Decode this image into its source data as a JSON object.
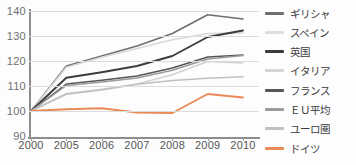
{
  "chart_data": {
    "type": "line",
    "title": "",
    "xlabel": "",
    "ylabel": "",
    "x": [
      "2000",
      "2005",
      "2006",
      "2007",
      "2008",
      "2009",
      "2010"
    ],
    "ylim": [
      90,
      140
    ],
    "yticks": [
      90,
      100,
      110,
      120,
      130,
      140
    ],
    "grid": true,
    "legend_position": "right",
    "series": [
      {
        "name": "ギリシャ",
        "color": "#6e6e6e",
        "values": [
          100,
          118,
          122,
          126,
          131,
          138.5,
          136.8
        ]
      },
      {
        "name": "スペイン",
        "color": "#d8d8d8",
        "values": [
          100,
          117.5,
          121.5,
          125,
          128.5,
          131,
          131.2
        ]
      },
      {
        "name": "英国",
        "color": "#3c3c3c",
        "values": [
          100,
          113.3,
          115.5,
          118,
          122,
          129.6,
          132.2
        ]
      },
      {
        "name": "イタリア",
        "color": "#d2d2d2",
        "values": [
          100,
          107,
          108.7,
          110.8,
          114.5,
          119.8,
          119.2
        ]
      },
      {
        "name": "フランス",
        "color": "#565656",
        "values": [
          100,
          110.8,
          112.3,
          114,
          117.2,
          121.6,
          122.4
        ]
      },
      {
        "name": "ＥＵ平均",
        "color": "#9a9a9a",
        "values": [
          100,
          110.2,
          111.6,
          113.2,
          116.3,
          120.8,
          122.2
        ]
      },
      {
        "name": "ユーロ圏",
        "color": "#c0c0c0",
        "values": [
          100,
          106.7,
          108.4,
          110.7,
          112.2,
          113.1,
          113.7
        ]
      },
      {
        "name": "ドイツ",
        "color": "#ea8b57",
        "values": [
          100,
          100.7,
          101.1,
          99.4,
          99.2,
          106.8,
          105.4
        ]
      }
    ]
  },
  "axes": {
    "y_tick_labels": [
      "140",
      "130",
      "120",
      "110",
      "100",
      "90"
    ],
    "x_tick_labels": [
      "2000",
      "2005",
      "2006",
      "2007",
      "2008",
      "2009",
      "2010"
    ]
  },
  "legend": {
    "items": [
      {
        "label": "ギリシャ",
        "color": "#6e6e6e"
      },
      {
        "label": "スペイン",
        "color": "#dedede"
      },
      {
        "label": "英国",
        "color": "#3c3c3c"
      },
      {
        "label": "イタリア",
        "color": "#d4d4d4"
      },
      {
        "label": "フランス",
        "color": "#565656"
      },
      {
        "label": "ＥＵ平均",
        "color": "#9a9a9a"
      },
      {
        "label": "ユーロ圏",
        "color": "#c0c0c0"
      },
      {
        "label": "ドイツ",
        "color": "#ea8b57"
      }
    ]
  },
  "title_strip": {
    "text": ""
  }
}
